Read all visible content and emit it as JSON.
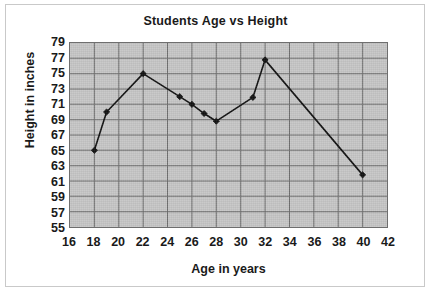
{
  "chart_data": {
    "type": "line",
    "title": "Students Age vs Height",
    "xlabel": "Age in years",
    "ylabel": "Height in inches",
    "xlim": [
      16,
      42
    ],
    "ylim": [
      55,
      79
    ],
    "xticks": [
      16,
      18,
      20,
      22,
      24,
      26,
      28,
      30,
      32,
      34,
      36,
      38,
      40,
      42
    ],
    "yticks": [
      55,
      57,
      59,
      61,
      63,
      65,
      67,
      69,
      71,
      73,
      75,
      77,
      79
    ],
    "grid": true,
    "legend": false,
    "marker": "diamond",
    "series": [
      {
        "name": "Students",
        "x": [
          18,
          19,
          22,
          25,
          26,
          27,
          28,
          31,
          32,
          40
        ],
        "y": [
          65,
          70,
          75,
          72,
          71,
          69.8,
          68.8,
          71.9,
          76.8,
          61.8
        ]
      }
    ]
  },
  "style": {
    "plot_background": "#c6c6c6",
    "line_color": "#101010",
    "grid_color": "#6e6e6e",
    "text_color": "#1a1a1a",
    "figure_background": "#ffffff"
  }
}
